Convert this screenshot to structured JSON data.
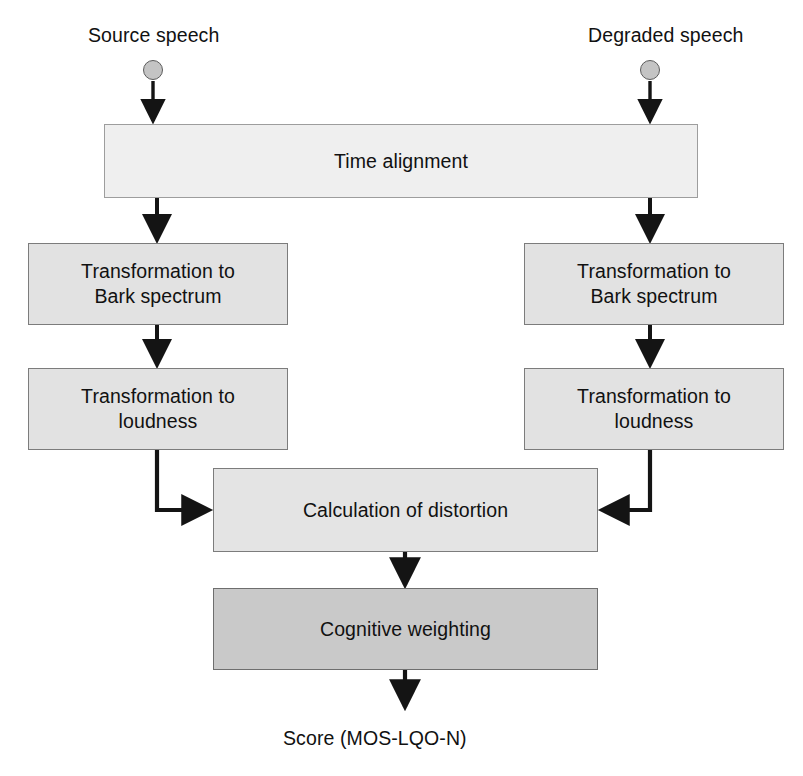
{
  "diagram": {
    "background_color": "#ffffff",
    "line_color": "#141414",
    "canvas": {
      "width": 803,
      "height": 776
    },
    "inputs": [
      {
        "id": "source-speech",
        "label": "Source speech",
        "dot_color": "#c4c4c4",
        "label_x": 88,
        "label_y": 24,
        "dot_cx": 153,
        "dot_cy": 70,
        "dot_r": 10
      },
      {
        "id": "degraded-speech",
        "label": "Degraded speech",
        "dot_color": "#c4c4c4",
        "label_x": 588,
        "label_y": 24,
        "dot_cx": 650,
        "dot_cy": 70,
        "dot_r": 10
      }
    ],
    "nodes": [
      {
        "id": "time-alignment",
        "label": "Time alignment",
        "shade": "light",
        "fill": "#efefef",
        "x": 104,
        "y": 124,
        "w": 594,
        "h": 74
      },
      {
        "id": "bark-left",
        "label": "Transformation to\nBark spectrum",
        "shade": "mid",
        "fill": "#e2e2e2",
        "x": 28,
        "y": 243,
        "w": 260,
        "h": 82
      },
      {
        "id": "bark-right",
        "label": "Transformation to\nBark spectrum",
        "shade": "mid",
        "fill": "#e2e2e2",
        "x": 524,
        "y": 243,
        "w": 260,
        "h": 82
      },
      {
        "id": "loudness-left",
        "label": "Transformation to\nloudness",
        "shade": "mid",
        "fill": "#e2e2e2",
        "x": 28,
        "y": 368,
        "w": 260,
        "h": 82
      },
      {
        "id": "loudness-right",
        "label": "Transformation to\nloudness",
        "shade": "mid",
        "fill": "#e2e2e2",
        "x": 524,
        "y": 368,
        "w": 260,
        "h": 82
      },
      {
        "id": "calculation-of-distortion",
        "label": "Calculation of distortion",
        "shade": "mid",
        "fill": "#e4e4e4",
        "x": 213,
        "y": 468,
        "w": 385,
        "h": 84
      },
      {
        "id": "cognitive-weighting",
        "label": "Cognitive weighting",
        "shade": "dark",
        "fill": "#c9c9c9",
        "x": 213,
        "y": 588,
        "w": 385,
        "h": 82
      }
    ],
    "output": {
      "id": "score",
      "label": "Score (MOS-LQO-N)",
      "label_x": 283,
      "label_y": 727
    },
    "edges": [
      {
        "id": "edge-source-to-time-alignment",
        "from": "source-speech",
        "to": "time-alignment",
        "kind": "straight-down"
      },
      {
        "id": "edge-degraded-to-time-alignment",
        "from": "degraded-speech",
        "to": "time-alignment",
        "kind": "straight-down"
      },
      {
        "id": "edge-time-alignment-to-bark-left",
        "from": "time-alignment",
        "to": "bark-left",
        "kind": "straight-down"
      },
      {
        "id": "edge-time-alignment-to-bark-right",
        "from": "time-alignment",
        "to": "bark-right",
        "kind": "straight-down"
      },
      {
        "id": "edge-bark-left-to-loudness-left",
        "from": "bark-left",
        "to": "loudness-left",
        "kind": "straight-down"
      },
      {
        "id": "edge-bark-right-to-loudness-right",
        "from": "bark-right",
        "to": "loudness-right",
        "kind": "straight-down"
      },
      {
        "id": "edge-loudness-left-to-distortion",
        "from": "loudness-left",
        "to": "calculation-of-distortion",
        "kind": "elbow-down-right"
      },
      {
        "id": "edge-loudness-right-to-distortion",
        "from": "loudness-right",
        "to": "calculation-of-distortion",
        "kind": "elbow-down-left"
      },
      {
        "id": "edge-distortion-to-cognitive",
        "from": "calculation-of-distortion",
        "to": "cognitive-weighting",
        "kind": "straight-down"
      },
      {
        "id": "edge-cognitive-to-score",
        "from": "cognitive-weighting",
        "to": "score",
        "kind": "straight-down"
      }
    ]
  }
}
